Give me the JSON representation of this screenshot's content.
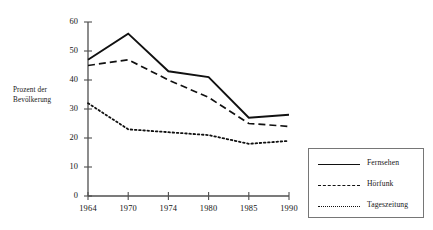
{
  "chart_data": {
    "type": "line",
    "title": "",
    "xlabel": "",
    "ylabel": "Prozent der Bevölkerung",
    "ylabel_line1": "Prozent der",
    "ylabel_line2": "Bevölkerung",
    "categories": [
      "1964",
      "1970",
      "1974",
      "1980",
      "1985",
      "1990"
    ],
    "yticks": [
      "0",
      "10",
      "20",
      "30",
      "40",
      "50",
      "60"
    ],
    "ylim": [
      0,
      60
    ],
    "grid": false,
    "legend_position": "right-bottom",
    "series": [
      {
        "name": "Fernsehen",
        "style": "solid",
        "color": "#111111",
        "values": [
          47,
          56,
          43,
          41,
          27,
          28
        ]
      },
      {
        "name": "Hörfunk",
        "style": "dashed",
        "color": "#111111",
        "values": [
          45,
          47,
          40,
          34,
          25,
          24
        ]
      },
      {
        "name": "Tageszeitung",
        "style": "dotted",
        "color": "#111111",
        "values": [
          32,
          23,
          22,
          21,
          18,
          19
        ]
      }
    ]
  },
  "axis": {
    "line_color": "#4f4f4f"
  },
  "legend": {
    "border_color": "#767676"
  }
}
